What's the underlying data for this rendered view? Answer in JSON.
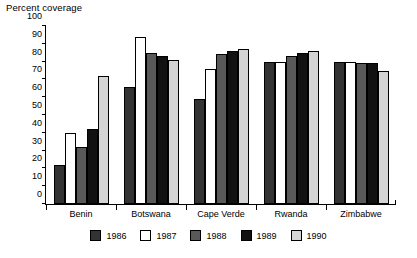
{
  "chart_data": {
    "type": "bar",
    "title": "Percent coverage",
    "xlabel": "",
    "ylabel": "",
    "ylim": [
      0,
      100
    ],
    "ytick_step": 10,
    "yticks": [
      100,
      90,
      80,
      70,
      60,
      50,
      40,
      30,
      20,
      10,
      0
    ],
    "grid": false,
    "legend_position": "bottom",
    "categories": [
      "Benin",
      "Botswana",
      "Cape Verde",
      "Rwanda",
      "Zimbabwe"
    ],
    "series": [
      {
        "name": "1986",
        "color": "#333333",
        "values": [
          22,
          66,
          59,
          80,
          80
        ]
      },
      {
        "name": "1987",
        "color": "#ffffff",
        "values": [
          40,
          94,
          76,
          80,
          80
        ]
      },
      {
        "name": "1988",
        "color": "#595959",
        "values": [
          32,
          85,
          84,
          83,
          79
        ]
      },
      {
        "name": "1989",
        "color": "#111111",
        "values": [
          42,
          83,
          86,
          85,
          79
        ]
      },
      {
        "name": "1990",
        "color": "#d4d4d4",
        "values": [
          72,
          81,
          87,
          86,
          75
        ]
      }
    ]
  }
}
